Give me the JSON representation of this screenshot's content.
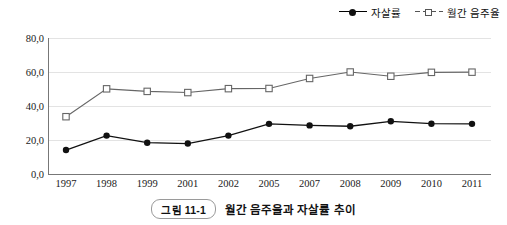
{
  "chart_data": {
    "type": "line",
    "title": "월간 음주율과 자살률 추이",
    "figure_number": "그림 11-1",
    "xlabel": "",
    "ylabel": "",
    "ylim": [
      0,
      80
    ],
    "yticks": [
      "0,0",
      "20,0",
      "40,0",
      "60,0",
      "80,0"
    ],
    "ytick_values": [
      0,
      20,
      40,
      60,
      80
    ],
    "grid": true,
    "legend_position": "top-right",
    "categories": [
      "1997",
      "1998",
      "1999",
      "2001",
      "2002",
      "2005",
      "2007",
      "2008",
      "2009",
      "2010",
      "2011"
    ],
    "series": [
      {
        "name": "자살률",
        "marker": "filled-circle",
        "color": "#111111",
        "values": [
          14.1,
          22.6,
          18.4,
          17.9,
          22.6,
          29.5,
          28.6,
          28.1,
          31.0,
          29.6,
          29.5
        ]
      },
      {
        "name": "월간 음주율",
        "marker": "open-square",
        "color": "#666666",
        "values": [
          33.7,
          50.1,
          48.6,
          47.9,
          50.2,
          50.3,
          56.2,
          60.0,
          57.5,
          59.8,
          59.9
        ]
      }
    ]
  },
  "legend": {
    "items": [
      {
        "label": "자살률",
        "marker": "filled-circle"
      },
      {
        "label": "월간 음주율",
        "marker": "open-square"
      }
    ]
  },
  "caption": {
    "badge": "그림 11-1",
    "text": "월간 음주율과 자살률 추이"
  }
}
